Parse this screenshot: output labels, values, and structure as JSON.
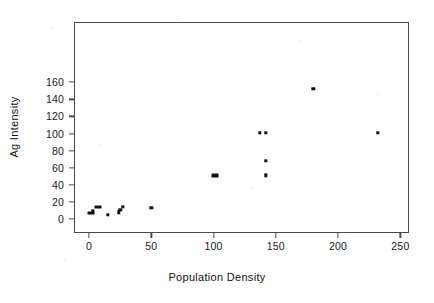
{
  "chart_data": {
    "type": "scatter",
    "title": "",
    "xlabel": "Population Density",
    "ylabel": "Ag Intensity",
    "xlim": [
      -12,
      257
    ],
    "ylim": [
      -9,
      170
    ],
    "xticks": [
      0,
      50,
      100,
      150,
      200,
      250
    ],
    "yticks": [
      0,
      20,
      40,
      60,
      80,
      100,
      120,
      140,
      160
    ],
    "grid": false,
    "legend": null,
    "marker": "filled-square",
    "marker_color": "#111111",
    "axis_color": "#4a4a4a",
    "background": "#ffffff",
    "points": [
      {
        "x": 1,
        "y": 7
      },
      {
        "x": 2,
        "y": 6
      },
      {
        "x": 3,
        "y": 9
      },
      {
        "x": 6,
        "y": 14
      },
      {
        "x": 8,
        "y": 14
      },
      {
        "x": 15,
        "y": 5
      },
      {
        "x": 24,
        "y": 8
      },
      {
        "x": 25,
        "y": 11
      },
      {
        "x": 27,
        "y": 14
      },
      {
        "x": 50,
        "y": 13
      },
      {
        "x": 100,
        "y": 51
      },
      {
        "x": 103,
        "y": 51
      },
      {
        "x": 137,
        "y": 101
      },
      {
        "x": 142,
        "y": 101
      },
      {
        "x": 142,
        "y": 68
      },
      {
        "x": 142,
        "y": 51
      },
      {
        "x": 180,
        "y": 152
      },
      {
        "x": 232,
        "y": 101
      }
    ]
  },
  "axes": {
    "xtick_labels": [
      "0",
      "50",
      "100",
      "150",
      "200",
      "250"
    ],
    "ytick_labels": [
      "0",
      "20",
      "40",
      "60",
      "80",
      "100",
      "120",
      "140",
      "160"
    ],
    "xaxis_title": "Population Density",
    "yaxis_title": "Ag Intensity"
  }
}
